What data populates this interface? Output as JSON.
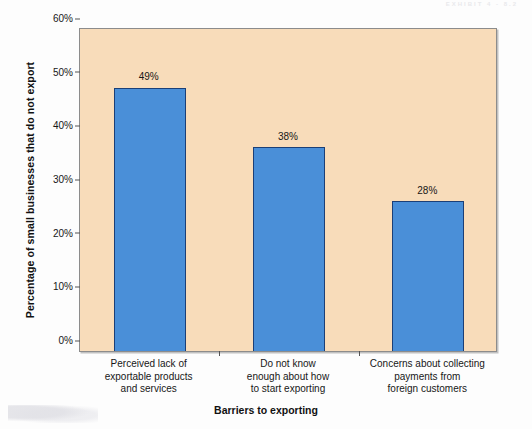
{
  "page": {
    "scan_header": "EXHIBIT 4 - 8.2"
  },
  "chart_data": {
    "type": "bar",
    "title": "",
    "subtitle": "",
    "xlabel": "Barriers to exporting",
    "ylabel": "Percentage of small businesses that  do not export",
    "categories": [
      "Perceived lack of\nexportable products\nand services",
      "Do not know\nenough about how\nto start exporting",
      "Concerns about collecting\npayments from\nforeign customers"
    ],
    "category_lines": [
      [
        "Perceived lack of",
        "exportable products",
        "and services"
      ],
      [
        "Do not know",
        "enough about how",
        "to start exporting"
      ],
      [
        "Concerns about collecting",
        "payments from",
        "foreign customers"
      ]
    ],
    "values": [
      49,
      38,
      28
    ],
    "value_labels": [
      "49%",
      "38%",
      "28%"
    ],
    "ylim": [
      0,
      60
    ],
    "ytick_values": [
      0,
      10,
      20,
      30,
      40,
      50,
      60
    ],
    "ytick_labels": [
      "0%",
      "10%",
      "20%",
      "30%",
      "40%",
      "50%",
      "60%"
    ],
    "grid": false,
    "legend": false,
    "colors": {
      "bar_fill": "#4a8fd8",
      "bar_border": "#1b3f77",
      "plot_background": "#f8dcba",
      "axis": "#8c8c8c",
      "text": "#171717",
      "page_background": "#fdfdfd"
    }
  }
}
